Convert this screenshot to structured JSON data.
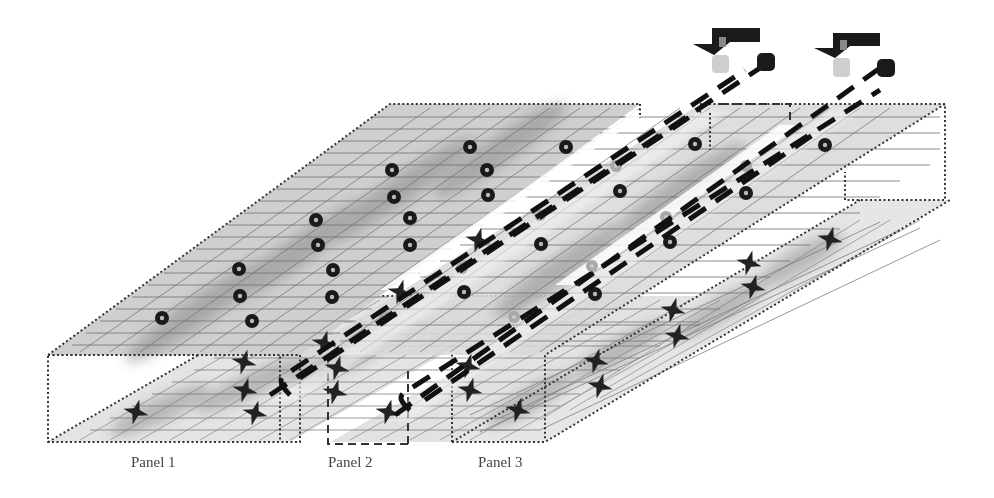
{
  "diagram": {
    "title": "",
    "panels": [
      {
        "id": "panel1",
        "label": "Panel 1"
      },
      {
        "id": "panel2",
        "label": "Panel 2"
      },
      {
        "id": "panel3",
        "label": "Panel 3"
      }
    ],
    "top_layer": {
      "marker": "ring",
      "count": 16
    },
    "bottom_layer": {
      "marker": "cross",
      "count": 20
    },
    "beams": {
      "count": 2,
      "style": "dashed"
    },
    "sources": {
      "count": 2,
      "icon": "arrow-down-source-icon"
    },
    "colors": {
      "plate": "#c8c8c8",
      "plate_light": "#e6e6e6",
      "blob": "#9a9a9a",
      "grid": "#6e6e6e",
      "marker": "#1a1a1a",
      "ghost_marker": "#a8a8a8",
      "dash": "#111111",
      "label": "#444444"
    }
  }
}
